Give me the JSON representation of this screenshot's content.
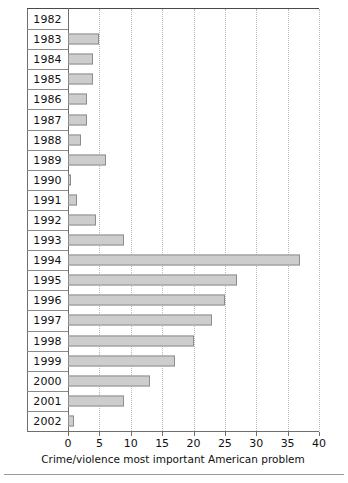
{
  "chart_data": {
    "type": "bar",
    "orientation": "horizontal",
    "title": "",
    "subtitle": "",
    "xlabel": "Crime/violence most important American problem",
    "ylabel": "",
    "xlim": [
      0,
      40
    ],
    "xticks": [
      0,
      5,
      10,
      15,
      20,
      25,
      30,
      35,
      40
    ],
    "xtick_labels": [
      "0",
      "5",
      "10",
      "15",
      "20",
      "25",
      "30",
      "35",
      "40"
    ],
    "grid": "vertical-dotted",
    "legend": null,
    "categories": [
      "1982",
      "1983",
      "1984",
      "1985",
      "1986",
      "1987",
      "1988",
      "1989",
      "1990",
      "1991",
      "1992",
      "1993",
      "1994",
      "1995",
      "1996",
      "1997",
      "1998",
      "1999",
      "2000",
      "2001",
      "2002"
    ],
    "values": [
      0,
      5,
      4,
      4,
      3,
      3,
      2,
      6,
      0.5,
      1.5,
      4.5,
      9,
      37,
      27,
      25,
      23,
      20,
      17,
      13,
      9,
      1
    ],
    "series": [
      {
        "name": "Crime/violence most important American problem",
        "values": [
          0,
          5,
          4,
          4,
          3,
          3,
          2,
          6,
          0.5,
          1.5,
          4.5,
          9,
          37,
          27,
          25,
          23,
          20,
          17,
          13,
          9,
          1
        ]
      }
    ],
    "colors": {
      "bar_fill": "#cdcdcd",
      "bar_border": "#8d8d8d",
      "axis": "#6e6e6e",
      "gridline": "#b9b9b9",
      "text": "#111111"
    }
  }
}
